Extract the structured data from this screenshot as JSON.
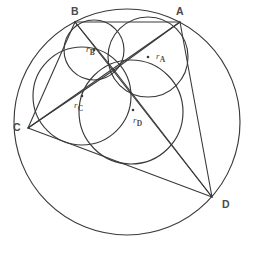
{
  "figure": {
    "stroke_color": "#3a3a3a",
    "background_color": "#ffffff",
    "label_color": "#4a4a4a",
    "vertices": [
      {
        "id": "A",
        "label": "A",
        "x": 180,
        "y": 22,
        "label_x": 176,
        "label_y": 6
      },
      {
        "id": "B",
        "label": "B",
        "x": 75,
        "y": 22,
        "label_x": 71,
        "label_y": 6
      },
      {
        "id": "C",
        "label": "C",
        "x": 28,
        "y": 128,
        "label_x": 13,
        "label_y": 122
      },
      {
        "id": "D",
        "label": "D",
        "x": 212,
        "y": 197,
        "label_x": 222,
        "label_y": 199
      }
    ],
    "circumcircle": {
      "cx": 127,
      "cy": 122,
      "r": 113
    },
    "common_point": {
      "x": 114,
      "y": 70
    },
    "inner_circles": [
      {
        "id": "A",
        "label": "r",
        "subscript": "A",
        "cx": 148,
        "cy": 57,
        "r": 40,
        "center_dot_x": 148,
        "center_dot_y": 57,
        "label_x": 156,
        "label_y": 52
      },
      {
        "id": "B",
        "label": "r",
        "subscript": "B",
        "cx": 94,
        "cy": 50,
        "r": 30,
        "center_dot_x": 94,
        "center_dot_y": 50,
        "label_x": 86,
        "label_y": 45
      },
      {
        "id": "C",
        "label": "r",
        "subscript": "C",
        "cx": 82,
        "cy": 96,
        "r": 49,
        "center_dot_x": 82,
        "center_dot_y": 96,
        "label_x": 74,
        "label_y": 101
      },
      {
        "id": "D",
        "label": "r",
        "subscript": "D",
        "cx": 131,
        "cy": 112,
        "r": 52,
        "center_dot_x": 133,
        "center_dot_y": 110,
        "label_x": 133,
        "label_y": 116
      }
    ],
    "chords": [
      {
        "id": "AB",
        "from": "B",
        "to": "A"
      },
      {
        "id": "BC",
        "from": "C",
        "to": "B"
      },
      {
        "id": "CD",
        "from": "C",
        "to": "D"
      },
      {
        "id": "DA",
        "from": "D",
        "to": "A"
      },
      {
        "id": "AC",
        "from": "A",
        "to": "C"
      },
      {
        "id": "BD",
        "from": "B",
        "to": "D"
      }
    ],
    "spokes": [
      {
        "id": "PA",
        "to": "A"
      },
      {
        "id": "PB",
        "to": "B"
      },
      {
        "id": "PC",
        "to": "C"
      },
      {
        "id": "PD",
        "to": "D"
      }
    ]
  }
}
